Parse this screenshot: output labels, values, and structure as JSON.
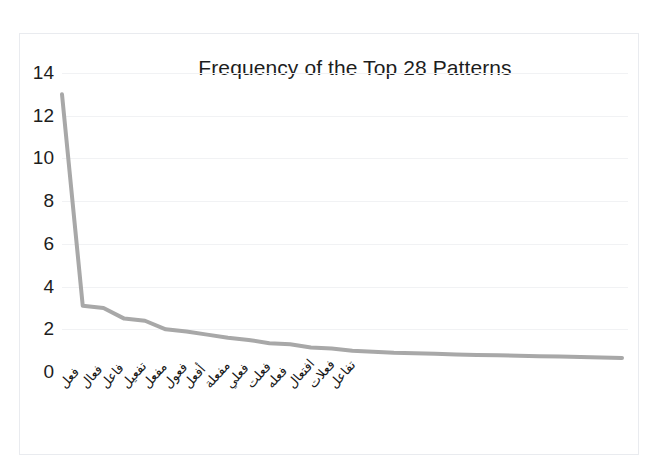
{
  "figure": {
    "background_color": "#ffffff",
    "frame_color": "#e9ebef"
  },
  "chart_data": {
    "type": "line",
    "title": "Frequency of the Top 28 Patterns",
    "xlabel": "",
    "ylabel": "",
    "ylim": [
      0,
      14
    ],
    "ytick_step": 2,
    "yticks": [
      0,
      2,
      4,
      6,
      8,
      10,
      12,
      14
    ],
    "grid": true,
    "legend": null,
    "line_color": "#a8a8a8",
    "line_width": 4,
    "categories": [
      "فعل",
      "فعال",
      "فاعل",
      "تفعيل",
      "مفعل",
      "فعول",
      "أفعل",
      "مفعلة",
      "فعلي",
      "فعلت",
      "فعله",
      "افتعال",
      "فعلات",
      "تفاعل",
      "",
      "",
      "",
      "",
      "",
      "",
      "",
      "",
      "",
      "",
      "",
      "",
      "",
      ""
    ],
    "values": [
      13.0,
      3.1,
      3.0,
      2.5,
      2.4,
      2.0,
      1.9,
      1.75,
      1.6,
      1.5,
      1.35,
      1.3,
      1.15,
      1.1,
      1.0,
      0.95,
      0.9,
      0.88,
      0.85,
      0.82,
      0.8,
      0.78,
      0.76,
      0.74,
      0.72,
      0.7,
      0.68,
      0.66
    ],
    "visible_tick_labels": [
      "فعل",
      "فعال",
      "فاعل",
      "تفعيل",
      "مفعل",
      "فعول",
      "أفعل",
      "مفعلة",
      "فعلي",
      "فعلت",
      "فعله",
      "افتعال",
      "فعلات",
      "تفاعل"
    ]
  }
}
